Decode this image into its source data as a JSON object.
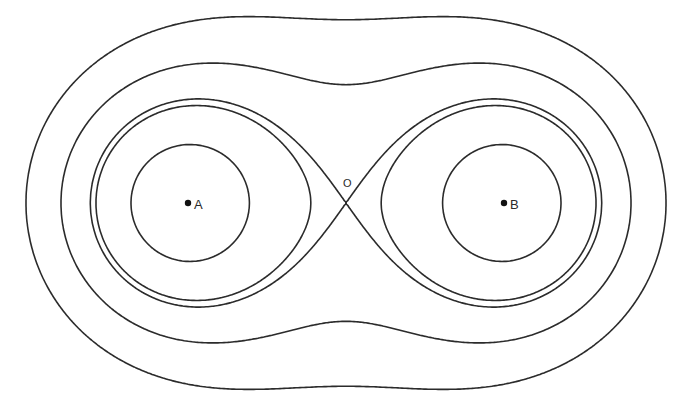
{
  "figure": {
    "type": "contour-diagram",
    "stroke_color": "#2b2b2b",
    "background": "#ffffff"
  },
  "points": [
    {
      "id": "A",
      "label": "A",
      "x": 188,
      "y": 203
    },
    {
      "id": "B",
      "label": "B",
      "x": 504,
      "y": 203
    }
  ],
  "saddle": {
    "id": "O",
    "label": "O",
    "x": 346,
    "y": 203,
    "label_x": 343,
    "label_y": 187
  },
  "contours": {
    "left_extents_x": [
      26,
      61,
      96,
      131
    ],
    "count": 5
  }
}
